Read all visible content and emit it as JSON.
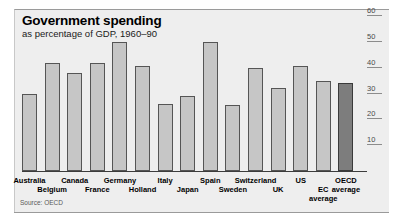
{
  "chart_data": {
    "type": "bar",
    "title": "Government spending",
    "subtitle": "as percentage of GDP, 1960–90",
    "source": "Source: OECD",
    "xlabel": "",
    "ylabel": "",
    "ylim": [
      0,
      60
    ],
    "yticks": [
      10,
      20,
      30,
      40,
      50,
      60
    ],
    "grid": false,
    "legend": false,
    "categories": [
      "Australia",
      "Belgium",
      "Canada",
      "France",
      "Germany",
      "Holland",
      "Italy",
      "Japan",
      "Spain",
      "Sweden",
      "Switzerland",
      "UK",
      "US",
      "EC average",
      "OECD average"
    ],
    "values": [
      30,
      42,
      38,
      42,
      50,
      40.5,
      26,
      29,
      50,
      25.5,
      40,
      32,
      40.5,
      35,
      34
    ],
    "highlight_index": 14,
    "colors": {
      "bar": "#c6c6c6",
      "bar_border": "#555555",
      "bar_highlight": "#7d7d7d",
      "panel_background": "#eeeeee",
      "axis": "#3c3c3c",
      "text": "#000000"
    }
  },
  "labels": {
    "row_top": [
      {
        "text": "Australia",
        "index": 0
      },
      {
        "text": "Canada",
        "index": 2
      },
      {
        "text": "Germany",
        "index": 4
      },
      {
        "text": "Italy",
        "index": 6
      },
      {
        "text": "Spain",
        "index": 8
      },
      {
        "text": "Switzerland",
        "index": 10
      },
      {
        "text": "US",
        "index": 12
      }
    ],
    "row_bottom": [
      {
        "text": "Belgium",
        "index": 1
      },
      {
        "text": "France",
        "index": 3
      },
      {
        "text": "Holland",
        "index": 5
      },
      {
        "text": "Japan",
        "index": 7
      },
      {
        "text": "Sweden",
        "index": 9
      },
      {
        "text": "UK",
        "index": 11
      }
    ],
    "ec_average_line1": "EC",
    "ec_average_line2": "average",
    "oecd_average_line1": "OECD",
    "oecd_average_line2": "average"
  }
}
